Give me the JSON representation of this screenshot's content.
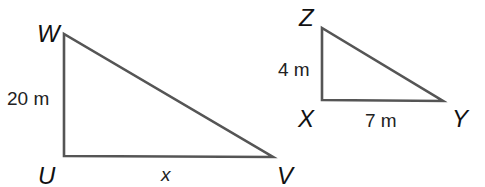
{
  "diagram": {
    "type": "similar-right-triangles",
    "stroke_color": "#555555",
    "text_color": "#111111",
    "triangles": [
      {
        "name": "triangle-UVW",
        "vertices": {
          "W": {
            "label": "W",
            "x": 64,
            "y": 34
          },
          "U": {
            "label": "U",
            "x": 64,
            "y": 156
          },
          "V": {
            "label": "V",
            "x": 273,
            "y": 157
          }
        },
        "right_angle_at": "U",
        "side_labels": {
          "WU": "20 m",
          "UV": "x"
        }
      },
      {
        "name": "triangle-XYZ",
        "vertices": {
          "Z": {
            "label": "Z",
            "x": 322,
            "y": 28
          },
          "X": {
            "label": "X",
            "x": 322,
            "y": 100
          },
          "Y": {
            "label": "Y",
            "x": 443,
            "y": 101
          }
        },
        "right_angle_at": "X",
        "side_labels": {
          "ZX": "4 m",
          "XY": "7 m"
        }
      }
    ]
  },
  "labels": {
    "W": "W",
    "U": "U",
    "V": "V",
    "Z": "Z",
    "X": "X",
    "Y": "Y",
    "side_WU": "20 m",
    "side_UV": "x",
    "side_ZX": "4 m",
    "side_XY": "7 m"
  }
}
